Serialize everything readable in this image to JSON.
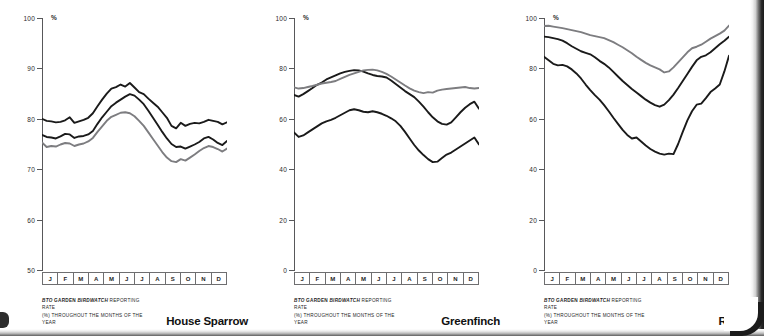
{
  "figure": {
    "panel_count": 3,
    "line_colors": {
      "upper_black": "#1a1a1a",
      "mid_black": "#1a1a1a",
      "grey": "#7d7d80"
    },
    "axis_color": "#58585a",
    "percent_symbol": "%"
  },
  "months": [
    "J",
    "F",
    "M",
    "A",
    "M",
    "J",
    "J",
    "A",
    "S",
    "O",
    "N",
    "D"
  ],
  "caption": {
    "line1_a": "BTO",
    "line1_b": " Garden ",
    "line1_c": "BirdWatch",
    "line1_d": " reporting rate",
    "line2": "(%) throughout the months of the year"
  },
  "panels": [
    {
      "species": "House Sparrow",
      "ylabels": [
        "100",
        "90",
        "80",
        "70",
        "60",
        "50"
      ]
    },
    {
      "species": "Greenfinch",
      "ylabels": [
        "100",
        "80",
        "60",
        "40",
        "20",
        "0"
      ]
    },
    {
      "species": "Robin",
      "ylabels": [
        "100",
        "80",
        "60",
        "40",
        "20",
        "0"
      ]
    }
  ],
  "chart_data": [
    {
      "type": "line",
      "title": "House Sparrow",
      "xlabel": "",
      "ylabel": "%",
      "ylim": [
        50,
        100
      ],
      "yticks": [
        50,
        60,
        70,
        80,
        90,
        100
      ],
      "grid": false,
      "legend": "none",
      "x": [
        "J",
        "F",
        "M",
        "A",
        "M",
        "J",
        "J",
        "A",
        "S",
        "O",
        "N",
        "D"
      ],
      "series": [
        {
          "name": "upper",
          "color": "#1a1a1a",
          "values": [
            80.0,
            79.6,
            79.5,
            79.3,
            79.4,
            79.7,
            80.3,
            79.2,
            79.5,
            79.8,
            80.2,
            81.1,
            82.5,
            83.8,
            85.0,
            86.0,
            86.3,
            86.8,
            86.4,
            87.1,
            86.2,
            85.3,
            84.9,
            84.0,
            83.2,
            82.4,
            81.3,
            80.2,
            78.6,
            78.1,
            79.2,
            78.6,
            79.0,
            79.2,
            79.1,
            79.4,
            79.8,
            79.6,
            79.4,
            78.9,
            79.3
          ]
        },
        {
          "name": "middle",
          "color": "#1a1a1a",
          "values": [
            76.8,
            76.4,
            76.3,
            76.1,
            76.5,
            77.0,
            76.9,
            76.2,
            76.5,
            76.6,
            76.9,
            77.6,
            79.0,
            80.3,
            81.4,
            82.5,
            83.2,
            83.8,
            84.4,
            84.9,
            84.6,
            83.8,
            82.9,
            81.6,
            80.2,
            78.8,
            77.4,
            76.1,
            75.0,
            74.4,
            74.5,
            74.1,
            74.5,
            74.9,
            75.4,
            76.1,
            76.4,
            75.9,
            75.2,
            74.8,
            75.6
          ]
        },
        {
          "name": "lower",
          "color": "#7d7d80",
          "values": [
            75.3,
            74.4,
            74.6,
            74.5,
            74.9,
            75.2,
            75.1,
            74.6,
            74.9,
            75.1,
            75.5,
            76.2,
            77.4,
            78.5,
            79.6,
            80.4,
            80.8,
            81.2,
            81.3,
            81.1,
            80.5,
            79.6,
            78.6,
            77.3,
            76.0,
            74.7,
            73.4,
            72.3,
            71.6,
            71.4,
            72.0,
            71.7,
            72.3,
            72.9,
            73.6,
            74.2,
            74.6,
            74.4,
            74.0,
            73.5,
            74.1
          ]
        }
      ]
    },
    {
      "type": "line",
      "title": "Greenfinch",
      "xlabel": "",
      "ylabel": "%",
      "ylim": [
        0,
        100
      ],
      "yticks": [
        0,
        20,
        40,
        60,
        80,
        100
      ],
      "grid": false,
      "legend": "none",
      "x": [
        "J",
        "F",
        "M",
        "A",
        "M",
        "J",
        "J",
        "A",
        "S",
        "O",
        "N",
        "D"
      ],
      "series": [
        {
          "name": "upper-black",
          "color": "#1a1a1a",
          "values": [
            69.5,
            68.8,
            69.8,
            71.0,
            72.2,
            73.5,
            74.4,
            75.6,
            76.4,
            77.2,
            78.0,
            78.6,
            79.0,
            79.3,
            79.2,
            78.7,
            78.0,
            77.4,
            77.0,
            76.8,
            76.4,
            75.2,
            73.8,
            72.4,
            71.0,
            69.8,
            68.6,
            66.8,
            64.8,
            62.6,
            60.6,
            59.0,
            58.0,
            57.7,
            58.6,
            60.6,
            62.6,
            64.4,
            65.8,
            66.8,
            64.0
          ]
        },
        {
          "name": "grey",
          "color": "#7d7d80",
          "values": [
            72.5,
            72.0,
            72.2,
            72.6,
            73.0,
            73.5,
            74.0,
            74.3,
            74.6,
            75.0,
            75.8,
            76.6,
            77.4,
            78.0,
            78.6,
            79.2,
            79.4,
            79.5,
            79.2,
            78.6,
            77.8,
            76.8,
            75.6,
            74.4,
            73.2,
            72.1,
            71.2,
            70.6,
            70.2,
            70.6,
            70.4,
            71.2,
            71.6,
            71.8,
            72.0,
            72.2,
            72.4,
            72.6,
            72.2,
            72.0,
            72.2
          ]
        },
        {
          "name": "lower-black",
          "color": "#1a1a1a",
          "values": [
            54.6,
            52.8,
            53.4,
            54.6,
            55.8,
            57.0,
            58.2,
            59.0,
            59.6,
            60.4,
            61.4,
            62.4,
            63.4,
            63.8,
            63.4,
            62.8,
            62.6,
            63.0,
            62.6,
            62.0,
            61.2,
            60.2,
            59.0,
            57.2,
            54.8,
            52.2,
            49.6,
            47.4,
            45.6,
            44.0,
            42.8,
            43.0,
            44.4,
            45.8,
            46.6,
            47.8,
            49.0,
            50.2,
            51.4,
            52.6,
            49.8
          ]
        }
      ]
    },
    {
      "type": "line",
      "title": "Robin",
      "xlabel": "",
      "ylabel": "%",
      "ylim": [
        0,
        100
      ],
      "yticks": [
        0,
        20,
        40,
        60,
        80,
        100
      ],
      "grid": false,
      "legend": "none",
      "x": [
        "J",
        "F",
        "M",
        "A",
        "M",
        "J",
        "J",
        "A",
        "S",
        "O",
        "N",
        "D"
      ],
      "series": [
        {
          "name": "grey",
          "color": "#7d7d80",
          "values": [
            96.8,
            96.9,
            96.6,
            96.3,
            96.0,
            95.6,
            95.2,
            94.8,
            94.4,
            93.8,
            93.2,
            92.8,
            92.4,
            92.0,
            91.2,
            90.4,
            89.4,
            88.4,
            87.2,
            86.0,
            84.6,
            83.4,
            82.2,
            81.2,
            80.4,
            79.6,
            78.4,
            78.8,
            80.4,
            82.4,
            84.4,
            86.4,
            88.0,
            88.6,
            89.4,
            90.6,
            91.8,
            92.8,
            93.8,
            95.0,
            97.0
          ]
        },
        {
          "name": "middle-black",
          "color": "#1a1a1a",
          "values": [
            92.6,
            92.4,
            92.0,
            91.6,
            91.0,
            90.0,
            88.8,
            87.8,
            86.8,
            86.2,
            85.6,
            84.4,
            83.0,
            81.8,
            80.4,
            78.6,
            76.8,
            75.0,
            73.4,
            71.8,
            70.4,
            69.0,
            67.6,
            66.4,
            65.4,
            64.8,
            65.6,
            67.4,
            69.6,
            72.2,
            75.0,
            77.8,
            80.6,
            83.2,
            84.6,
            85.2,
            86.4,
            88.0,
            89.6,
            91.0,
            92.6
          ]
        },
        {
          "name": "lower-black",
          "color": "#1a1a1a",
          "values": [
            84.6,
            83.2,
            81.8,
            81.2,
            81.4,
            80.8,
            79.6,
            78.0,
            76.0,
            73.6,
            71.4,
            69.4,
            67.6,
            65.4,
            63.0,
            60.4,
            58.0,
            55.6,
            53.6,
            52.2,
            52.6,
            51.0,
            49.4,
            48.0,
            47.0,
            46.2,
            45.8,
            46.2,
            46.0,
            50.0,
            54.8,
            59.4,
            63.0,
            65.6,
            66.0,
            68.2,
            70.6,
            72.0,
            73.6,
            78.8,
            85.0
          ]
        }
      ]
    }
  ]
}
